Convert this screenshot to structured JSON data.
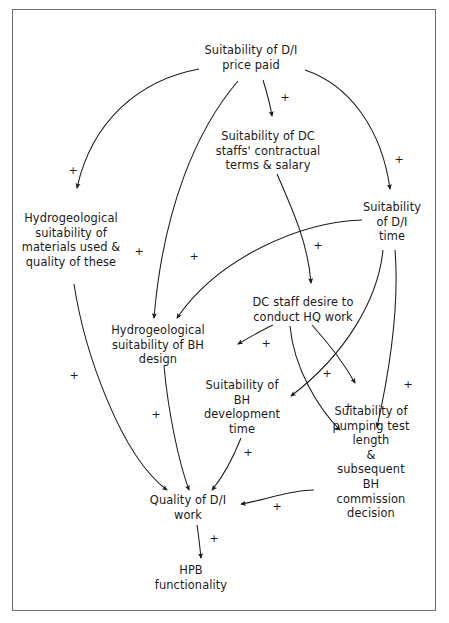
{
  "diagram": {
    "type": "causal-loop-diagram",
    "title": "",
    "border_color": "#6e6e6e",
    "line_color": "#1a1a1a",
    "background": "#ffffff",
    "nodes": [
      {
        "id": "price_paid",
        "label": "Suitability of D/I\nprice paid",
        "x": 251,
        "y": 58
      },
      {
        "id": "contractual_terms",
        "label": "Suitability of DC\nstaffs' contractual\nterms & salary",
        "x": 268,
        "y": 151
      },
      {
        "id": "materials",
        "label": "Hydrogeological\nsuitability of\nmaterials used &\nquality of these",
        "x": 71,
        "y": 240
      },
      {
        "id": "di_time",
        "label": "Suitability\nof D/I time",
        "x": 392,
        "y": 222
      },
      {
        "id": "hq_desire",
        "label": "DC staff desire to\nconduct HQ work",
        "x": 303,
        "y": 310
      },
      {
        "id": "bh_design",
        "label": "Hydrogeological\nsuitability of BH\ndesign",
        "x": 158,
        "y": 345
      },
      {
        "id": "bh_dev_time",
        "label": "Suitability of\nBH\ndevelopment\ntime",
        "x": 242,
        "y": 407
      },
      {
        "id": "pumping_test",
        "label": "Suitability of\npumping test length\n& subsequent BH\ncommission decision",
        "x": 371,
        "y": 462
      },
      {
        "id": "quality",
        "label": "Quality of D/I\nwork",
        "x": 188,
        "y": 508
      },
      {
        "id": "hpb",
        "label": "HPB\nfunctionality",
        "x": 191,
        "y": 578
      }
    ],
    "links": [
      {
        "from": "price_paid",
        "to": "materials",
        "sign": "+",
        "sign_x": 73,
        "sign_y": 170
      },
      {
        "from": "price_paid",
        "to": "contractual_terms",
        "sign": "+",
        "sign_x": 285,
        "sign_y": 97
      },
      {
        "from": "price_paid",
        "to": "di_time",
        "sign": "+",
        "sign_x": 399,
        "sign_y": 159
      },
      {
        "from": "price_paid",
        "to": "bh_design",
        "sign": "+",
        "sign_x": 139,
        "sign_y": 251
      },
      {
        "from": "contractual_terms",
        "to": "hq_desire",
        "sign": "+",
        "sign_x": 318,
        "sign_y": 245
      },
      {
        "from": "di_time",
        "to": "bh_design",
        "sign": "+",
        "sign_x": 194,
        "sign_y": 256
      },
      {
        "from": "di_time",
        "to": "bh_dev_time",
        "sign": "+",
        "sign_x": 327,
        "sign_y": 373
      },
      {
        "from": "di_time",
        "to": "pumping_test",
        "sign": "+",
        "sign_x": 408,
        "sign_y": 384
      },
      {
        "from": "hq_desire",
        "to": "bh_design",
        "sign": "+",
        "sign_x": 266,
        "sign_y": 343
      },
      {
        "from": "hq_desire",
        "to": "bh_dev_time",
        "sign": "+",
        "sign_x": 348,
        "sign_y": 406
      },
      {
        "from": "materials",
        "to": "quality",
        "sign": "+",
        "sign_x": 74,
        "sign_y": 375
      },
      {
        "from": "bh_design",
        "to": "quality",
        "sign": "+",
        "sign_x": 156,
        "sign_y": 414
      },
      {
        "from": "bh_dev_time",
        "to": "quality",
        "sign": "+",
        "sign_x": 248,
        "sign_y": 452
      },
      {
        "from": "pumping_test",
        "to": "quality",
        "sign": "+",
        "sign_x": 277,
        "sign_y": 506
      },
      {
        "from": "quality",
        "to": "hpb",
        "sign": "+",
        "sign_x": 214,
        "sign_y": 538
      }
    ]
  }
}
